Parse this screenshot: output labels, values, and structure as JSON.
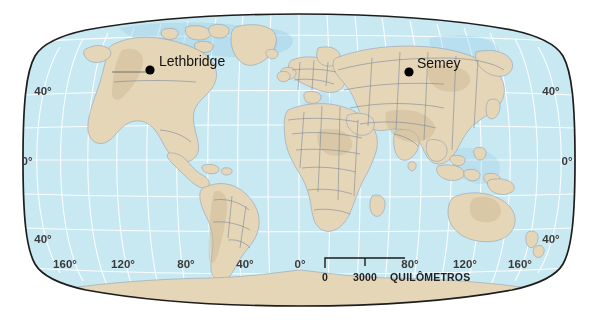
{
  "figure": {
    "type": "world-map",
    "projection": "Robinson",
    "background_color": "#ffffff"
  },
  "map": {
    "ocean_color": "#c9e9f2",
    "land_color": "#e6d6b8",
    "border_color": "#7b8898",
    "graticule_color": "#ffffff",
    "frame_color": "#1d1d1d",
    "shelf_color": "#9ed0e8"
  },
  "cities": [
    {
      "name": "Lethbridge",
      "dot_x": 150,
      "dot_y": 70,
      "label_x": 159,
      "label_y": 66,
      "anchor": "start"
    },
    {
      "name": "Semey",
      "dot_x": 409,
      "dot_y": 72,
      "label_x": 417,
      "label_y": 68,
      "anchor": "start"
    }
  ],
  "latitude_labels_left": [
    {
      "text": "40°",
      "x": 43,
      "y": 95
    },
    {
      "text": "0°",
      "x": 27,
      "y": 165
    },
    {
      "text": "40°",
      "x": 43,
      "y": 243
    }
  ],
  "latitude_labels_right": [
    {
      "text": "40°",
      "x": 545,
      "y": 95
    },
    {
      "text": "0°",
      "x": 562,
      "y": 165
    },
    {
      "text": "40°",
      "x": 545,
      "y": 243
    }
  ],
  "longitude_labels": [
    {
      "text": "160°",
      "x": 65,
      "y": 268
    },
    {
      "text": "120°",
      "x": 123,
      "y": 268
    },
    {
      "text": "80°",
      "x": 186,
      "y": 268
    },
    {
      "text": "40°",
      "x": 245,
      "y": 268
    },
    {
      "text": "0°",
      "x": 300,
      "y": 268
    },
    {
      "text": "80°",
      "x": 410,
      "y": 268
    },
    {
      "text": "120°",
      "x": 462,
      "y": 268
    },
    {
      "text": "160°",
      "x": 518,
      "y": 268
    }
  ],
  "scale_bar": {
    "start_label": "0",
    "mid_label": "3000",
    "units_label": "QUILÔMETROS",
    "bar_left": 325,
    "bar_right": 405,
    "bar_y": 262,
    "tick_mid": 365,
    "text_y": 285
  }
}
